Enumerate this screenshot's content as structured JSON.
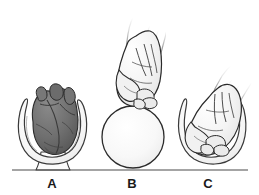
{
  "figure": {
    "background_color": "#ffffff",
    "width": 259,
    "height": 195
  },
  "baseline": {
    "color": "#4a4a4a",
    "x_start": 12,
    "x_end": 248,
    "y": 170
  },
  "panels": [
    {
      "id": "a",
      "label": "A",
      "label_x": 52,
      "label_y": 186,
      "subject": "heart-in-pericardium",
      "description": "Anatomical heart resting inside an open pericardial sac on a stalk",
      "heart_fill": "#6f6f6f",
      "heart_shadow": "#565656",
      "heart_outline": "#2a2a2a",
      "sac_fill": "#fbfbfb",
      "sac_outline": "#3a3a3a"
    },
    {
      "id": "b",
      "label": "B",
      "label_x": 131,
      "label_y": 186,
      "subject": "fist-above-sphere",
      "description": "Closed fist held above a plain sphere for size comparison",
      "sphere_fill": "#f7f7f7",
      "sphere_outline": "#2b2b2b",
      "sphere_diameter": 62,
      "hand_fill": "#f5f5f5",
      "hand_outline": "#2a2a2a"
    },
    {
      "id": "c",
      "label": "C",
      "label_x": 207,
      "label_y": 186,
      "subject": "fist-in-pericardial-sac",
      "description": "Closed fist nestled inside the cupped pericardial sac",
      "sac_fill": "#fbfbfb",
      "sac_outline": "#3a3a3a",
      "hand_fill": "#f5f5f5",
      "hand_outline": "#2a2a2a"
    }
  ],
  "colors": {
    "line": "#4a4a4a",
    "ink": "#1a1a1a",
    "heart_gray": "#6f6f6f",
    "paper": "#ffffff"
  }
}
